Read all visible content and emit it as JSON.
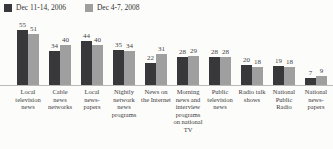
{
  "chart_data": {
    "type": "bar",
    "title": "",
    "categories": [
      "Local television news",
      "Cable news networks",
      "Local news-papers",
      "Nightly network news programs",
      "News on the Internet",
      "Morning news and interview programs on national TV",
      "Public television news",
      "Radio talk shows",
      "National Public Radio",
      "National news-papers"
    ],
    "series": [
      {
        "name": "Dec 11-14, 2006",
        "color": "#38383b",
        "values": [
          55,
          34,
          44,
          35,
          22,
          28,
          28,
          20,
          19,
          7
        ]
      },
      {
        "name": "Dec 4-7, 2008",
        "color": "#9f9f9f",
        "values": [
          51,
          40,
          40,
          34,
          31,
          29,
          28,
          18,
          18,
          9
        ]
      }
    ],
    "ylim": [
      0,
      60
    ],
    "value_labels": true,
    "grid": false,
    "legend_position": "top-left",
    "baseline_color": "#b9b9b9",
    "px_per_unit": 1
  }
}
